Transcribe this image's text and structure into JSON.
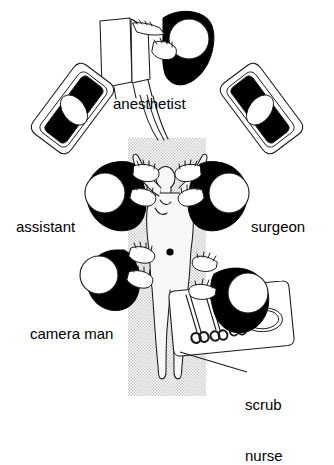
{
  "figure": {
    "type": "operating-room-team-layout",
    "title_visible": false,
    "colors": {
      "ink": "#000000",
      "background": "#ffffff",
      "table_gray": "#d0d0d0",
      "patient_fill": "#f2f2f2",
      "gown_black": "#000000",
      "cap_white": "#ffffff"
    }
  },
  "labels": {
    "anesthetist": "anesthetist",
    "assistant": "assistant",
    "surgeon": "surgeon",
    "camera_man": "camera man",
    "scrub_nurse_line1": "scrub",
    "scrub_nurse_line2": "nurse"
  },
  "elements": {
    "operating_table": "operating-table",
    "patient": "patient-supine-arms-raised",
    "port_site_mark": "umbilical-port-dot",
    "anesthesia_machine": "anesthesia-machine",
    "monitor_left": "video-monitor-left",
    "monitor_right": "video-monitor-right",
    "instrument_table": "instrument-table",
    "instruments": [
      "scissors",
      "scissors",
      "forceps",
      "kidney-dish"
    ],
    "leader_line_scrub_nurse": "leader-line"
  },
  "staff": [
    {
      "id": "anesthetist",
      "label": "anesthetist",
      "position": "head-of-table"
    },
    {
      "id": "assistant",
      "label": "assistant",
      "position": "patient-left-upper"
    },
    {
      "id": "surgeon",
      "label": "surgeon",
      "position": "patient-right-upper"
    },
    {
      "id": "camera-man",
      "label": "camera man",
      "position": "patient-left-lower"
    },
    {
      "id": "scrub-nurse",
      "label": "scrub nurse",
      "position": "patient-right-lower"
    }
  ]
}
